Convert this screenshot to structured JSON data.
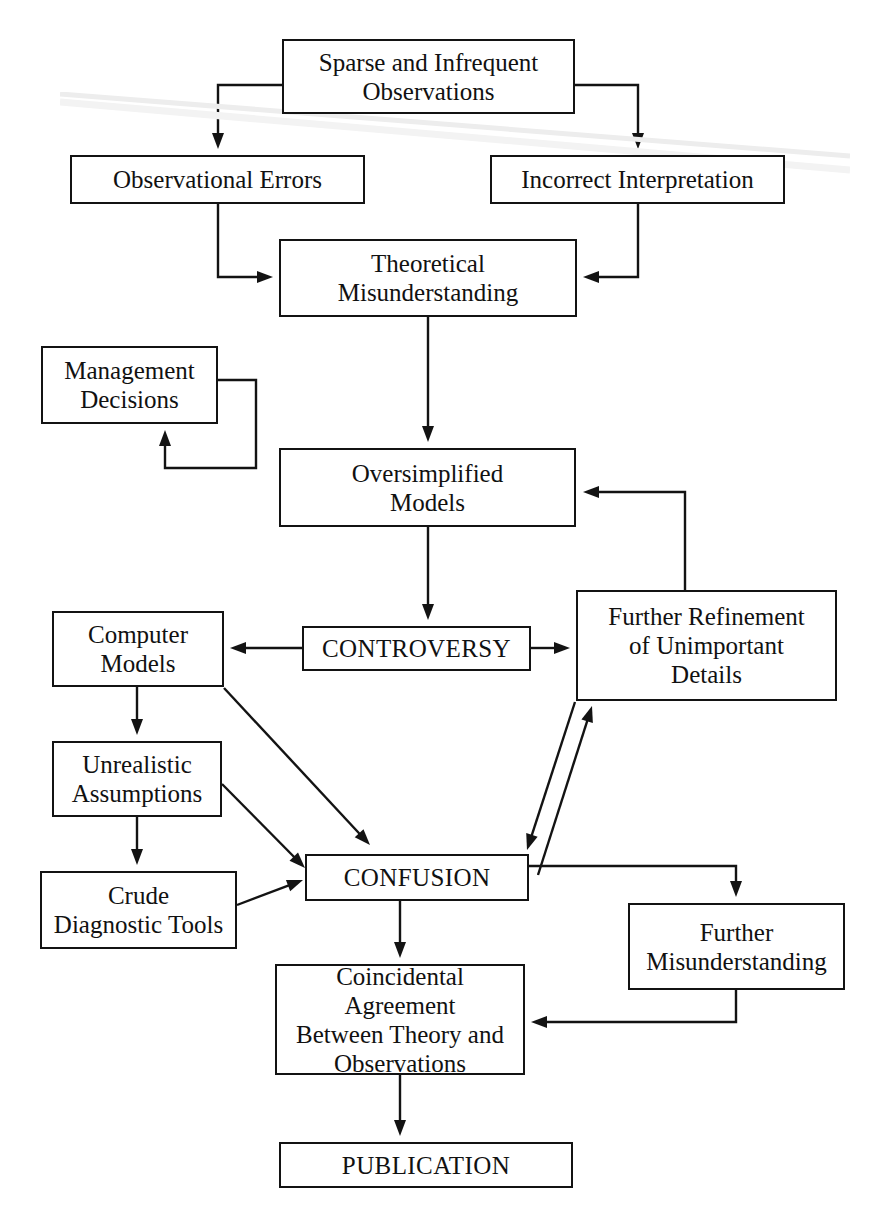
{
  "diagram": {
    "stroke_color": "#131313",
    "text_color": "#111111",
    "background": "#ffffff",
    "nodes": [
      {
        "id": "sparse",
        "label": "Sparse and Infrequent\nObservations",
        "x": 282,
        "y": 39,
        "w": 293,
        "h": 75
      },
      {
        "id": "obs_errors",
        "label": "Observational Errors",
        "x": 70,
        "y": 155,
        "w": 295,
        "h": 49
      },
      {
        "id": "incorrect",
        "label": "Incorrect Interpretation",
        "x": 490,
        "y": 155,
        "w": 295,
        "h": 49
      },
      {
        "id": "theoretical",
        "label": "Theoretical\nMisunderstanding",
        "x": 279,
        "y": 239,
        "w": 298,
        "h": 78
      },
      {
        "id": "management",
        "label": "Management\nDecisions",
        "x": 41,
        "y": 346,
        "w": 177,
        "h": 78
      },
      {
        "id": "oversimplified",
        "label": "Oversimplified\nModels",
        "x": 279,
        "y": 448,
        "w": 297,
        "h": 79
      },
      {
        "id": "computer",
        "label": "Computer\nModels",
        "x": 52,
        "y": 611,
        "w": 172,
        "h": 76
      },
      {
        "id": "controversy",
        "label": "CONTROVERSY",
        "x": 302,
        "y": 626,
        "w": 229,
        "h": 45,
        "caps": true
      },
      {
        "id": "refinement",
        "label": "Further Refinement\nof Unimportant\nDetails",
        "x": 576,
        "y": 590,
        "w": 261,
        "h": 111
      },
      {
        "id": "unrealistic",
        "label": "Unrealistic\nAssumptions",
        "x": 52,
        "y": 741,
        "w": 170,
        "h": 76
      },
      {
        "id": "crude",
        "label": "Crude\nDiagnostic Tools",
        "x": 40,
        "y": 871,
        "w": 197,
        "h": 78
      },
      {
        "id": "confusion",
        "label": "CONFUSION",
        "x": 305,
        "y": 854,
        "w": 224,
        "h": 47,
        "caps": true
      },
      {
        "id": "further_mis",
        "label": "Further\nMisunderstanding",
        "x": 628,
        "y": 903,
        "w": 217,
        "h": 87
      },
      {
        "id": "coincidental",
        "label": "Coincidental Agreement\nBetween Theory and\nObservations",
        "x": 275,
        "y": 964,
        "w": 250,
        "h": 111
      },
      {
        "id": "publication",
        "label": "PUBLICATION",
        "x": 279,
        "y": 1142,
        "w": 294,
        "h": 46,
        "caps": true
      }
    ],
    "edges": [
      {
        "from": "sparse",
        "to": "obs_errors",
        "points": "282,85 218,85 218,149",
        "arrow": "down"
      },
      {
        "from": "sparse",
        "to": "incorrect",
        "points": "575,85 638,85 638,149",
        "arrow": "down"
      },
      {
        "from": "obs_errors",
        "to": "theoretical",
        "points": "218,204 218,277 273,277",
        "arrow": "right"
      },
      {
        "from": "incorrect",
        "to": "theoretical",
        "points": "638,204 638,277 583,277",
        "arrow": "left"
      },
      {
        "from": "theoretical",
        "to": "oversimplified",
        "points": "428,317 428,442",
        "arrow": "down"
      },
      {
        "from": "management",
        "to": "management",
        "points": "218,380 256,380 256,468 165,468 165,430",
        "arrow": "up"
      },
      {
        "from": "oversimplified",
        "to": "controversy",
        "points": "428,527 428,620",
        "arrow": "down"
      },
      {
        "from": "controversy",
        "to": "computer",
        "points": "302,648 230,648",
        "arrow": "left"
      },
      {
        "from": "controversy",
        "to": "refinement",
        "points": "531,648 570,648",
        "arrow": "right"
      },
      {
        "from": "refinement",
        "to": "oversimplified",
        "points": "685,590 685,492 583,492",
        "arrow": "left"
      },
      {
        "from": "computer",
        "to": "unrealistic",
        "points": "137,687 137,735",
        "arrow": "down"
      },
      {
        "from": "unrealistic",
        "to": "crude",
        "points": "137,817 137,865",
        "arrow": "down"
      },
      {
        "from": "computer",
        "to": "confusion",
        "points": "224,688 370,845",
        "arrow": "end"
      },
      {
        "from": "unrealistic",
        "to": "confusion",
        "points": "222,784 305,868",
        "arrow": "end"
      },
      {
        "from": "crude",
        "to": "confusion",
        "points": "237,905 303,880",
        "arrow": "end"
      },
      {
        "from": "refinement",
        "to": "confusion",
        "points": "575,702 527,850",
        "arrow": "end"
      },
      {
        "from": "confusion",
        "to": "refinement",
        "points": "538,875 592,706",
        "arrow": "end"
      },
      {
        "from": "confusion",
        "to": "further_mis",
        "points": "529,866 736,866 736,897",
        "arrow": "down"
      },
      {
        "from": "confusion",
        "to": "coincidental",
        "points": "400,901 400,958",
        "arrow": "down"
      },
      {
        "from": "further_mis",
        "to": "coincidental",
        "points": "736,990 736,1022 531,1022",
        "arrow": "left"
      },
      {
        "from": "coincidental",
        "to": "publication",
        "points": "400,1075 400,1136",
        "arrow": "down"
      }
    ]
  }
}
